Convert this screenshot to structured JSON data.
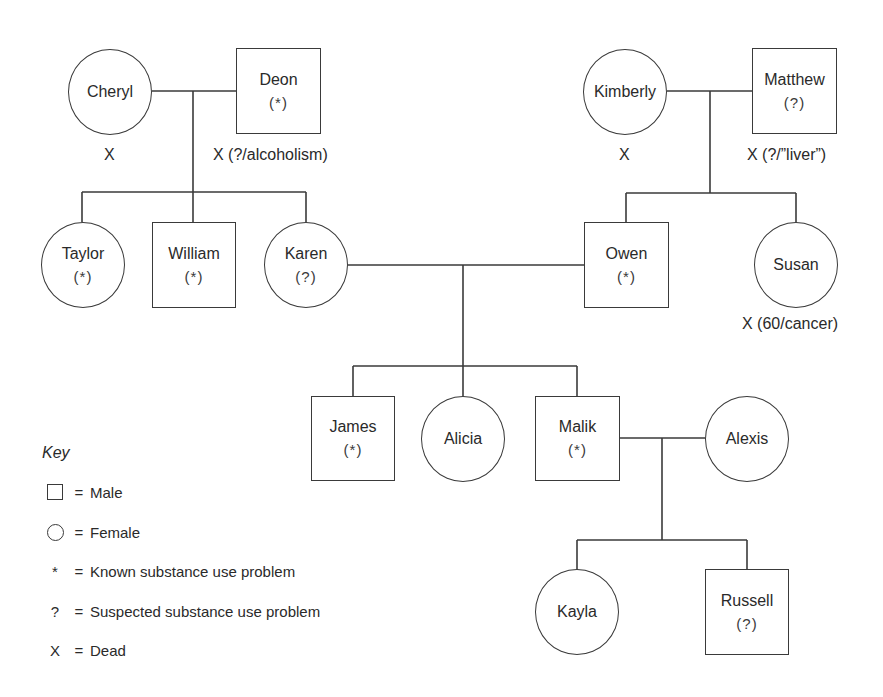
{
  "diagram": {
    "type": "genogram",
    "people": {
      "cheryl": {
        "name": "Cheryl",
        "sex": "female",
        "status": "",
        "note": "X"
      },
      "deon": {
        "name": "Deon",
        "sex": "male",
        "status": "(*)",
        "note": "X (?/alcoholism)"
      },
      "kimberly": {
        "name": "Kimberly",
        "sex": "female",
        "status": "",
        "note": "X"
      },
      "matthew": {
        "name": "Matthew",
        "sex": "male",
        "status": "(?)",
        "note": "X (?/”liver”)"
      },
      "taylor": {
        "name": "Taylor",
        "sex": "female",
        "status": "(*)",
        "note": ""
      },
      "william": {
        "name": "William",
        "sex": "male",
        "status": "(*)",
        "note": ""
      },
      "karen": {
        "name": "Karen",
        "sex": "female",
        "status": "(?)",
        "note": ""
      },
      "owen": {
        "name": "Owen",
        "sex": "male",
        "status": "(*)",
        "note": ""
      },
      "susan": {
        "name": "Susan",
        "sex": "female",
        "status": "",
        "note": "X (60/cancer)"
      },
      "james": {
        "name": "James",
        "sex": "male",
        "status": "(*)",
        "note": ""
      },
      "alicia": {
        "name": "Alicia",
        "sex": "female",
        "status": "",
        "note": ""
      },
      "malik": {
        "name": "Malik",
        "sex": "male",
        "status": "(*)",
        "note": ""
      },
      "alexis": {
        "name": "Alexis",
        "sex": "female",
        "status": "",
        "note": ""
      },
      "kayla": {
        "name": "Kayla",
        "sex": "female",
        "status": "",
        "note": ""
      },
      "russell": {
        "name": "Russell",
        "sex": "male",
        "status": "(?)",
        "note": ""
      }
    },
    "couples": [
      {
        "partners": [
          "Cheryl",
          "Deon"
        ],
        "children": [
          "Taylor",
          "William",
          "Karen"
        ]
      },
      {
        "partners": [
          "Kimberly",
          "Matthew"
        ],
        "children": [
          "Owen",
          "Susan"
        ]
      },
      {
        "partners": [
          "Karen",
          "Owen"
        ],
        "children": [
          "James",
          "Alicia",
          "Malik"
        ]
      },
      {
        "partners": [
          "Malik",
          "Alexis"
        ],
        "children": [
          "Kayla",
          "Russell"
        ]
      }
    ]
  },
  "key": {
    "title": "Key",
    "items": [
      {
        "symbol": "square",
        "glyph": "",
        "eq": "=",
        "label": "Male"
      },
      {
        "symbol": "circle",
        "glyph": "",
        "eq": "=",
        "label": "Female"
      },
      {
        "symbol": "asterisk",
        "glyph": "*",
        "eq": "=",
        "label": "Known substance use problem"
      },
      {
        "symbol": "question",
        "glyph": "?",
        "eq": "=",
        "label": "Suspected substance use problem"
      },
      {
        "symbol": "x",
        "glyph": "X",
        "eq": "=",
        "label": "Dead"
      }
    ]
  }
}
